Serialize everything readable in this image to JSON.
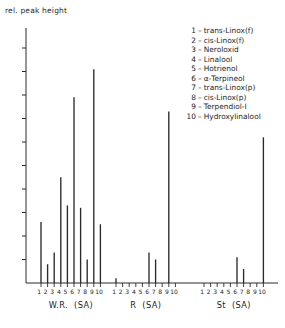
{
  "chart_data": {
    "type": "bar",
    "title": "",
    "ylabel": "rel. peak height",
    "xlabel": "",
    "grid": false,
    "legend_position": "top-right",
    "y_axis": {
      "ticks_count": 10,
      "labels": [],
      "ylim": [
        0,
        100
      ]
    },
    "categories": [
      "1",
      "2",
      "3",
      "4",
      "5",
      "6",
      "7",
      "8",
      "9",
      "10"
    ],
    "groups": [
      {
        "name": "W.R.  (SA)",
        "label_main": "W.R.",
        "label_sub": "(SA)",
        "values": [
          26,
          8,
          13,
          45,
          33,
          79,
          32,
          10,
          91,
          25
        ]
      },
      {
        "name": "R  (SA)",
        "label_main": "R",
        "label_sub": "(SA)",
        "values": [
          2,
          0,
          0,
          0,
          0,
          13,
          10,
          0,
          73,
          0
        ]
      },
      {
        "name": "St  (SA)",
        "label_main": "St",
        "label_sub": "(SA)",
        "values": [
          0,
          0,
          0,
          0,
          0,
          11,
          6,
          0,
          0,
          62
        ]
      }
    ],
    "legend": [
      {
        "num": "1",
        "name": "trans-Linox(f)"
      },
      {
        "num": "2",
        "name": "cis-Linox(f)"
      },
      {
        "num": "3",
        "name": "Neroloxid"
      },
      {
        "num": "4",
        "name": "Linalool"
      },
      {
        "num": "5",
        "name": "Hotrienol"
      },
      {
        "num": "6",
        "name": "α-Terpineol"
      },
      {
        "num": "7",
        "name": "trans-Linox(p)"
      },
      {
        "num": "8",
        "name": "cis-Linox(p)"
      },
      {
        "num": "9",
        "name": "Terpendiol-I"
      },
      {
        "num": "10",
        "name": "Hydroxylinalool"
      }
    ],
    "colors": {
      "axis": "#2a2a2a",
      "bar": "#2a2a2a",
      "background": "#ffffff",
      "text": "#1d1d1d"
    }
  }
}
